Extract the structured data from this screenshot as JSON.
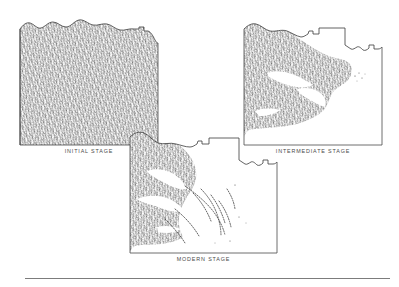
{
  "figure": {
    "title": "",
    "background_color": "#ffffff",
    "ink_color": "#3a3a3a",
    "caption_color": "#4a4a4a",
    "rule_color": "#7c7c7c"
  },
  "panels": [
    {
      "id": "initial",
      "caption": "INITIAL STAGE",
      "fill_description": "dense-stipple",
      "coverage_percent": 97
    },
    {
      "id": "intermediate",
      "caption": "INTERMEDIATE STAGE",
      "fill_description": "dense-stipple-with-clearings",
      "coverage_percent": 72
    },
    {
      "id": "modern",
      "caption": "MODERN STAGE",
      "fill_description": "sparse-stipple-dendritic",
      "coverage_percent": 38
    }
  ],
  "bottom_rule": {
    "label": "horizontal-rule"
  }
}
